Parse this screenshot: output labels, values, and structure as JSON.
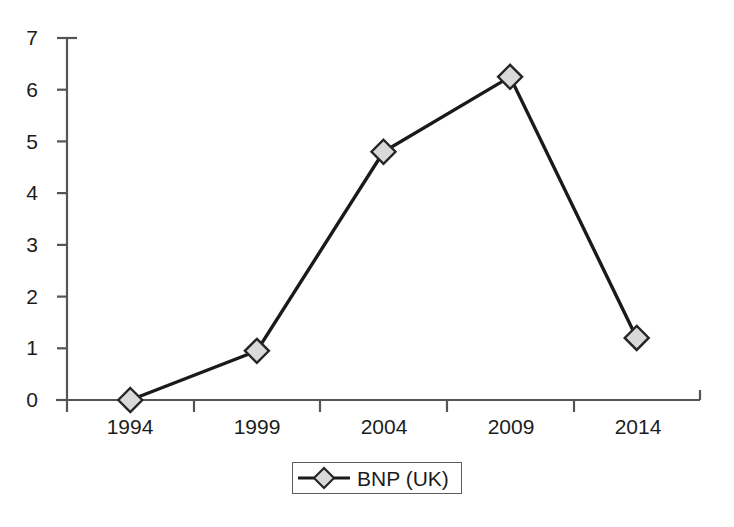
{
  "chart_data": {
    "type": "line",
    "title": "",
    "subtitle": "",
    "xlabel": "",
    "ylabel": "",
    "categories": [
      "1994",
      "1999",
      "2004",
      "2009",
      "2014"
    ],
    "series": [
      {
        "name": "BNP (UK)",
        "values": [
          0.0,
          0.95,
          4.8,
          6.25,
          1.2
        ],
        "marker": "diamond",
        "marker_fill": "#d9d9d9",
        "marker_edge": "#262626",
        "line_color": "#1a1a1a"
      }
    ],
    "ylim": [
      0,
      7
    ],
    "yticks": [
      0,
      1,
      2,
      3,
      4,
      5,
      6,
      7
    ],
    "ytick_labels": [
      "0",
      "1",
      "2",
      "3",
      "4",
      "5",
      "6",
      "7"
    ],
    "xtick_labels": [
      "1994",
      "1999",
      "2004",
      "2009",
      "2014"
    ],
    "grid": false,
    "legend": {
      "position": "bottom-center",
      "entries": [
        {
          "label": "BNP (UK)",
          "marker": "diamond-marker-icon"
        }
      ]
    },
    "axis_color": "#555555",
    "background": "#ffffff"
  },
  "axes": {
    "y_axis_name": "y-axis",
    "x_axis_name": "x-axis"
  }
}
